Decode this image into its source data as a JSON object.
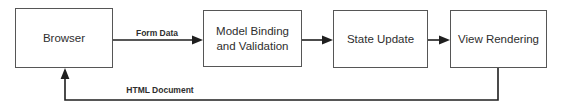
{
  "diagram": {
    "nodes": [
      {
        "id": "browser",
        "label": "Browser"
      },
      {
        "id": "model-binding",
        "label": "Model Binding and Validation"
      },
      {
        "id": "state-update",
        "label": "State Update"
      },
      {
        "id": "view-rendering",
        "label": "View Rendering"
      }
    ],
    "edges": [
      {
        "from": "browser",
        "to": "model-binding",
        "label": "Form Data"
      },
      {
        "from": "model-binding",
        "to": "state-update",
        "label": ""
      },
      {
        "from": "state-update",
        "to": "view-rendering",
        "label": ""
      },
      {
        "from": "view-rendering",
        "to": "browser",
        "label": "HTML Document"
      }
    ],
    "colors": {
      "background": "#ffffff",
      "box_border": "#565656",
      "box_fill": "#ffffff",
      "connector": "#1f1f1f",
      "text": "#2e2e2e"
    }
  }
}
